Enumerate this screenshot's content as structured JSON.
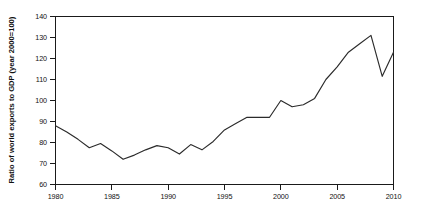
{
  "chart_data": {
    "type": "line",
    "title": "",
    "xlabel": "",
    "ylabel": "Ratio of world exports to GDP (year 2000=100)",
    "xlim": [
      1980,
      2010
    ],
    "ylim": [
      60,
      140
    ],
    "grid": false,
    "legend": "none",
    "x_ticks": [
      1980,
      1985,
      1990,
      1995,
      2000,
      2005,
      2010
    ],
    "y_ticks": [
      60,
      70,
      80,
      90,
      100,
      110,
      120,
      130,
      140
    ],
    "x_tick_labels": [
      "1980",
      "1985",
      "1990",
      "1995",
      "2000",
      "2005",
      "2010"
    ],
    "y_tick_labels": [
      "60",
      "70",
      "80",
      "90",
      "100",
      "110",
      "120",
      "130",
      "140"
    ],
    "series": [
      {
        "name": "Ratio of world exports to GDP",
        "color": "#2b2b2b",
        "x": [
          1980,
          1981,
          1982,
          1983,
          1984,
          1985,
          1986,
          1987,
          1988,
          1989,
          1990,
          1991,
          1992,
          1993,
          1994,
          1995,
          1996,
          1997,
          1998,
          1999,
          2000,
          2001,
          2002,
          2003,
          2004,
          2005,
          2006,
          2007,
          2008,
          2009,
          2010
        ],
        "values": [
          88,
          85,
          81.5,
          77.5,
          79.5,
          76,
          72,
          74,
          76.5,
          78.5,
          77.5,
          74.5,
          79,
          76.5,
          80.5,
          86,
          89,
          92,
          92,
          92,
          100,
          97,
          98,
          101,
          110,
          116,
          123,
          127,
          131,
          111.5,
          123
        ]
      }
    ]
  }
}
